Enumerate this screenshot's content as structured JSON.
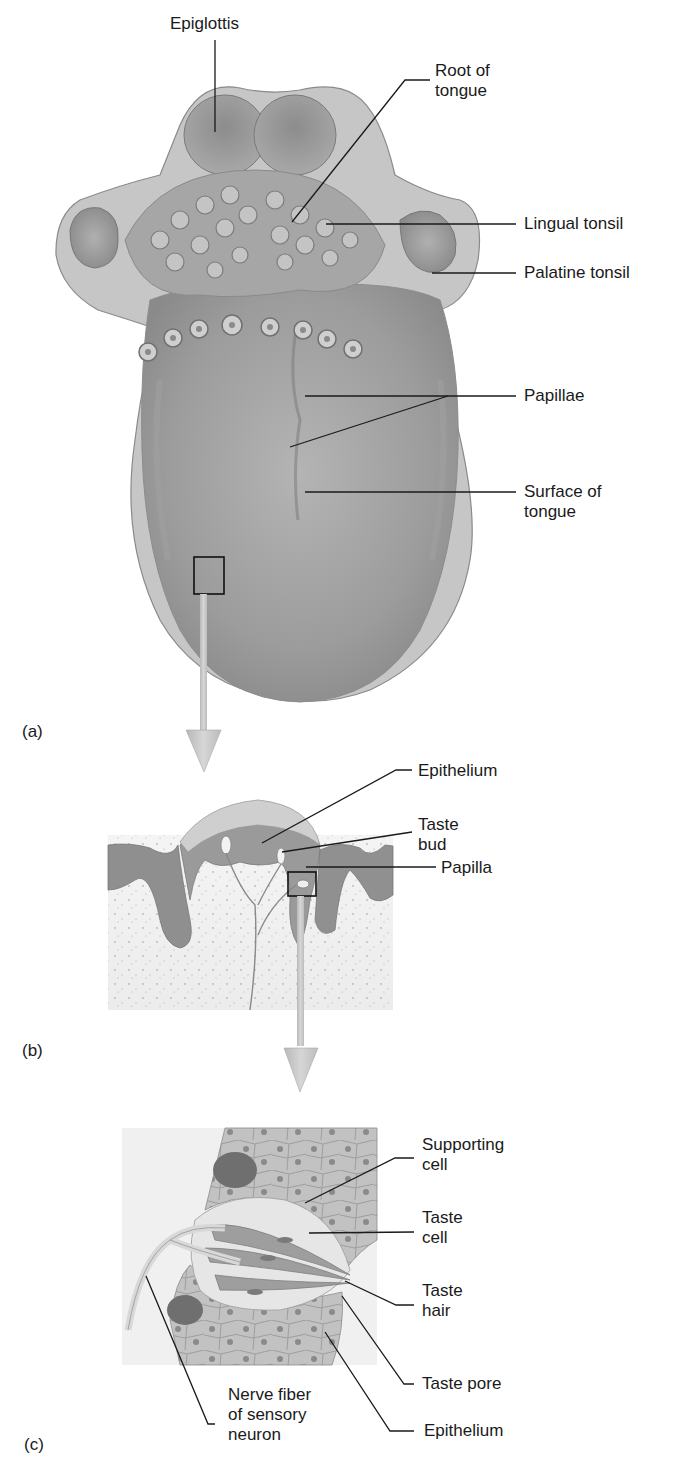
{
  "figure": {
    "panels": [
      {
        "id": "a",
        "letter": "(a)"
      },
      {
        "id": "b",
        "letter": "(b)"
      },
      {
        "id": "c",
        "letter": "(c)"
      }
    ],
    "panel_a_labels": {
      "epiglottis": "Epiglottis",
      "root_of_tongue": "Root of\ntongue",
      "lingual_tonsil": "Lingual tonsil",
      "palatine_tonsil": "Palatine tonsil",
      "papillae": "Papillae",
      "surface_of_tongue": "Surface of\ntongue"
    },
    "panel_b_labels": {
      "epithelium": "Epithelium",
      "taste_bud": "Taste\nbud",
      "papilla": "Papilla"
    },
    "panel_c_labels": {
      "supporting_cell": "Supporting\ncell",
      "taste_cell": "Taste\ncell",
      "taste_hair": "Taste\nhair",
      "taste_pore": "Taste pore",
      "epithelium": "Epithelium",
      "nerve_fiber": "Nerve fiber\nof sensory\nneuron"
    },
    "colors": {
      "background": "#ffffff",
      "tissue_mid": "#9a9a9a",
      "tissue_light": "#c8c8c8",
      "tissue_dark": "#6e6e6e",
      "arrow": "#c4c4c4",
      "leader_line": "#1a1a1a"
    }
  }
}
